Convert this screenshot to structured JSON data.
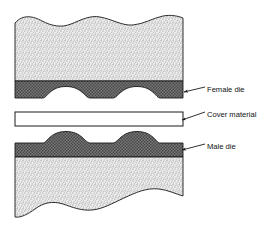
{
  "figure": {
    "background_color": "#ffffff"
  },
  "colors": {
    "stipple_fill": "#e8e8e8",
    "stipple_dot": "#9a9a9a",
    "die_fill": "#6f6f6f",
    "die_hatch": "#3d3d3d",
    "cover_fill": "#ffffff",
    "outline": "#1a1a1a",
    "leader": "#1a1a1a",
    "text": "#111111"
  },
  "parts": {
    "female_die": {
      "label": "Female die",
      "description": "upper hatched band with two concave cavities",
      "cavity_count": 2
    },
    "cover_material": {
      "label": "Cover material",
      "description": "white sheet between the dies"
    },
    "male_die": {
      "label": "Male die",
      "description": "lower hatched band with two convex bumps",
      "bump_count": 2
    },
    "upper_block": {
      "label": "upper stippled block",
      "description": "broken-away section above the female die"
    },
    "lower_block": {
      "label": "lower stippled block",
      "description": "broken-away section below the male die"
    }
  },
  "leaders": {
    "female_die_leader": "arrow pointing to female die band",
    "cover_material_leader": "arrow pointing to cover material sheet",
    "male_die_leader": "arrow pointing to male die band"
  }
}
